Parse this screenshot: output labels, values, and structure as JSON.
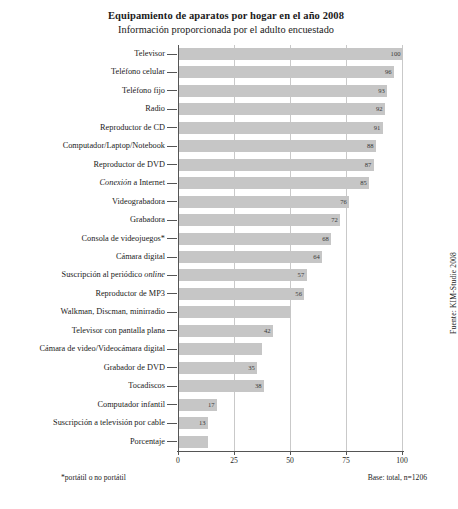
{
  "header": {
    "title": "Equipamiento de aparatos por hogar en el año 2008",
    "subtitle": "Información proporcionada por el adulto encuestado"
  },
  "footer": {
    "footnote": "*portátil o no portátil",
    "base": "Base: total, n=1206",
    "source": "Fuente: KIM-Studie 2008"
  },
  "chart_data": {
    "type": "bar",
    "orientation": "horizontal",
    "title": "Equipamiento de aparatos por hogar en el año 2008",
    "subtitle": "Información proporcionada por el adulto encuestado",
    "xlabel": "",
    "ylabel": "",
    "xlim": [
      0,
      100
    ],
    "xticks": [
      0,
      25,
      50,
      75,
      100
    ],
    "xtick_labels": [
      "0",
      "25",
      "50",
      "75",
      "100"
    ],
    "grid": true,
    "grid_axis": "x",
    "legend": false,
    "bar_color": "#c6c6c6",
    "categories": [
      "Televisor",
      "Teléfono celular",
      "Teléfono fijo",
      "Radio",
      "Reproductor de CD",
      "Computador/Laptop/Notebook",
      "Reproductor de DVD",
      "Conexión a Internet",
      "Videograbadora",
      "Grabadora",
      "Consola de videojuegos*",
      "Cámara digital",
      "Suscripción al periódico online",
      "Reproductor de MP3",
      "Walkman, Discman, minirradio",
      "Televisor con pantalla plana",
      "Cámara de video/Videocámara digital",
      "Grabador de DVD",
      "Tocadiscos",
      "Computador infantil",
      "Suscripción a televisión por cable",
      "Porcentaje"
    ],
    "values": [
      100,
      96,
      93,
      92,
      91,
      88,
      87,
      85,
      76,
      72,
      68,
      64,
      57,
      56,
      50,
      42,
      37,
      35,
      38,
      17,
      13,
      13
    ],
    "value_labels": [
      "100",
      "96",
      "93",
      "92",
      "91",
      "88",
      "87",
      "85",
      "76",
      "72",
      "68",
      "64",
      "57",
      "56",
      "",
      "42",
      "",
      "35",
      "38",
      "17",
      "13",
      ""
    ],
    "italic_categories": [
      "Conexión a Internet",
      "Suscripción al periódico online"
    ],
    "notes": [
      "*portátil o no portátil",
      "Base: total, n=1206",
      "Fuente: KIM-Studie 2008"
    ]
  }
}
